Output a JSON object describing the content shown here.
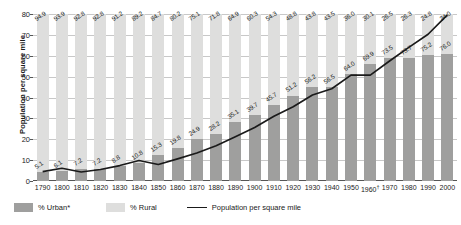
{
  "chart_data": {
    "type": "bar",
    "title": "",
    "subtitle": "",
    "xlabel": "",
    "ylabel": "Population per square mile",
    "ylim": [
      0,
      80
    ],
    "yticks": [
      0,
      10,
      20,
      30,
      40,
      50,
      60,
      70,
      80
    ],
    "grid": true,
    "legend_position": "bottom-left",
    "stacked": true,
    "categories": [
      "1790",
      "1800",
      "1810",
      "1820",
      "1830",
      "1840",
      "1850",
      "1860",
      "1870",
      "1880",
      "1890",
      "1900",
      "1910",
      "1920",
      "1930",
      "1940",
      "1950",
      "1960†",
      "1970",
      "1980",
      "1990",
      "2000"
    ],
    "series": [
      {
        "name": "% Urban*",
        "kind": "bar",
        "color": "#9f9f9e",
        "values": [
          5.1,
          6.1,
          7.2,
          7.2,
          8.8,
          10.8,
          15.3,
          19.8,
          24.9,
          28.2,
          35.1,
          39.7,
          45.7,
          51.2,
          56.2,
          56.5,
          64.0,
          69.9,
          73.5,
          73.7,
          75.2,
          76.0
        ]
      },
      {
        "name": "% Rural",
        "kind": "bar",
        "color": "#dededd",
        "values": [
          94.9,
          93.9,
          92.8,
          92.8,
          91.2,
          89.2,
          84.7,
          80.2,
          75.1,
          71.8,
          64.9,
          60.3,
          54.3,
          48.8,
          43.8,
          43.5,
          36.0,
          30.1,
          26.5,
          26.3,
          24.8,
          24.0
        ]
      },
      {
        "name": "Population per square mile",
        "kind": "line",
        "color": "#1a1a1a",
        "values": [
          4.5,
          6.1,
          4.3,
          5.5,
          7.4,
          9.8,
          7.9,
          10.6,
          13.4,
          16.9,
          21.2,
          25.6,
          31.0,
          35.6,
          41.2,
          44.2,
          50.7,
          50.7,
          57.5,
          64.0,
          70.3,
          79.6
        ]
      }
    ]
  },
  "legend": {
    "urban_label": "% Urban*",
    "rural_label": "% Rural",
    "line_label": "Population per square mile"
  },
  "axis": {
    "y_title": "Population per square mile"
  }
}
